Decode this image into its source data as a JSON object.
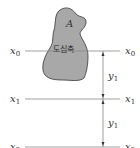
{
  "diagram": {
    "area_label": "A",
    "centroid_axis_label": "도심축",
    "axes": [
      {
        "name": "x",
        "sub": "0",
        "y": 51
      },
      {
        "name": "x",
        "sub": "1",
        "y": 99
      },
      {
        "name": "x",
        "sub": "2",
        "y": 147
      }
    ],
    "dimensions": [
      {
        "name": "y",
        "sub": "1"
      },
      {
        "name": "y",
        "sub": "1"
      }
    ],
    "colors": {
      "shape_fill": "#a8a8a8",
      "shape_stroke": "#333333",
      "line": "#888888",
      "text": "#333333"
    }
  }
}
